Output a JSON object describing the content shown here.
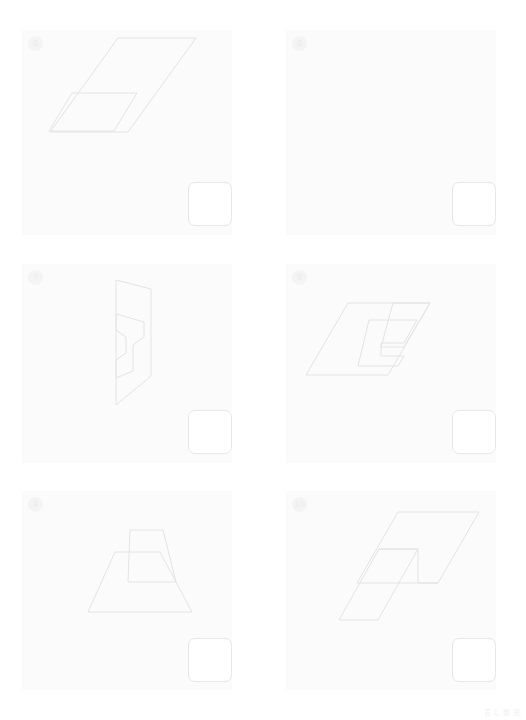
{
  "page": {
    "background_color": "#ffffff",
    "panel_background_color": "#fbfbfb",
    "stroke_color": "#e4e4e6",
    "answer_box_color": "#ffffff",
    "answer_box_border_color": "#e8e8e8",
    "footer_note": "答え 数 形"
  },
  "panels": [
    {
      "number": "5",
      "figure_name": "overlapping-parallelograms-large-small",
      "description": "A large parallelogram overlapped at its lower-left by a small parallelogram",
      "shapes": [
        {
          "name": "large-parallelogram",
          "points": "118,38 196,38 128,132 50,132"
        },
        {
          "name": "small-parallelogram",
          "points": "72,93 137,93 114,131 49,131"
        }
      ],
      "answer_box": {
        "x": 188,
        "y": 182,
        "w": 44,
        "h": 44
      }
    },
    {
      "number": "6",
      "figure_name": "nested-trapezoids",
      "description": "Three overlapping trapezoids forming a stepped pyramid",
      "shapes": [
        {
          "name": "outer-trapezoid",
          "points": "113,67 174,67 200,148 85,148"
        },
        {
          "name": "middle-trapezoid",
          "points": "134,53 155,53 165,114 105,114"
        },
        {
          "name": "inner-trapezoid",
          "points": "139,105 180,105 185,135 130,135"
        }
      ],
      "answer_box": {
        "x": 452,
        "y": 182,
        "w": 44,
        "h": 44
      }
    },
    {
      "number": "7",
      "figure_name": "vertical-panel-with-arrow",
      "description": "A tall slanted quadrilateral containing an inner arrow-like polygon",
      "shapes": [
        {
          "name": "outer-quadrilateral",
          "points": "116,280 151,289 151,376 116,405"
        },
        {
          "name": "inner-arrow-shape",
          "points": "116,314 144,322 144,337 133,345 133,371 116,378 116,360 126,353 126,337 116,330"
        }
      ],
      "answer_box": {
        "x": 188,
        "y": 410,
        "w": 44,
        "h": 44
      }
    },
    {
      "number": "8",
      "figure_name": "parallelogram-with-inner-spiral",
      "description": "A parallelogram containing nested inner parallelogram outlines",
      "shapes": [
        {
          "name": "outer-parallelogram",
          "points": "348,303 430,303 388,375 306,375"
        },
        {
          "name": "inner-shape-a",
          "points": "369,320 417,320 404,343 381,343 381,356 404,356 398,366 358,366"
        },
        {
          "name": "inner-shape-b",
          "points": "393,303 430,303 404,347 381,347"
        }
      ],
      "answer_box": {
        "x": 452,
        "y": 410,
        "w": 44,
        "h": 44
      }
    },
    {
      "number": "9",
      "figure_name": "trapezoid-pair-stacked",
      "description": "A wide trapezoid overlapped by a narrower trapezoid sitting above it",
      "shapes": [
        {
          "name": "large-trapezoid",
          "points": "115,552 160,552 192,612 88,612"
        },
        {
          "name": "small-trapezoid",
          "points": "130,530 163,530 176,582 128,582"
        }
      ],
      "answer_box": {
        "x": 188,
        "y": 638,
        "w": 44,
        "h": 44
      }
    },
    {
      "number": "10",
      "figure_name": "overlapping-parallelograms-offset",
      "description": "Two congruent parallelograms offset diagonally so they overlap",
      "shapes": [
        {
          "name": "upper-parallelogram",
          "points": "398,512 479,512 438,583 357,583"
        },
        {
          "name": "lower-parallelogram",
          "points": "379,549 418,549 378,620 339,620"
        },
        {
          "name": "overlap-path",
          "points": "379,549 418,549 418,583 438,583"
        }
      ],
      "answer_box": {
        "x": 452,
        "y": 638,
        "w": 44,
        "h": 44
      }
    }
  ],
  "panel_layout": [
    {
      "x": 22,
      "y": 30,
      "w": 210,
      "h": 205
    },
    {
      "x": 286,
      "y": 30,
      "w": 210,
      "h": 205
    },
    {
      "x": 22,
      "y": 264,
      "w": 210,
      "h": 199
    },
    {
      "x": 286,
      "y": 264,
      "w": 210,
      "h": 199
    },
    {
      "x": 22,
      "y": 491,
      "w": 210,
      "h": 199
    },
    {
      "x": 286,
      "y": 491,
      "w": 210,
      "h": 199
    }
  ]
}
